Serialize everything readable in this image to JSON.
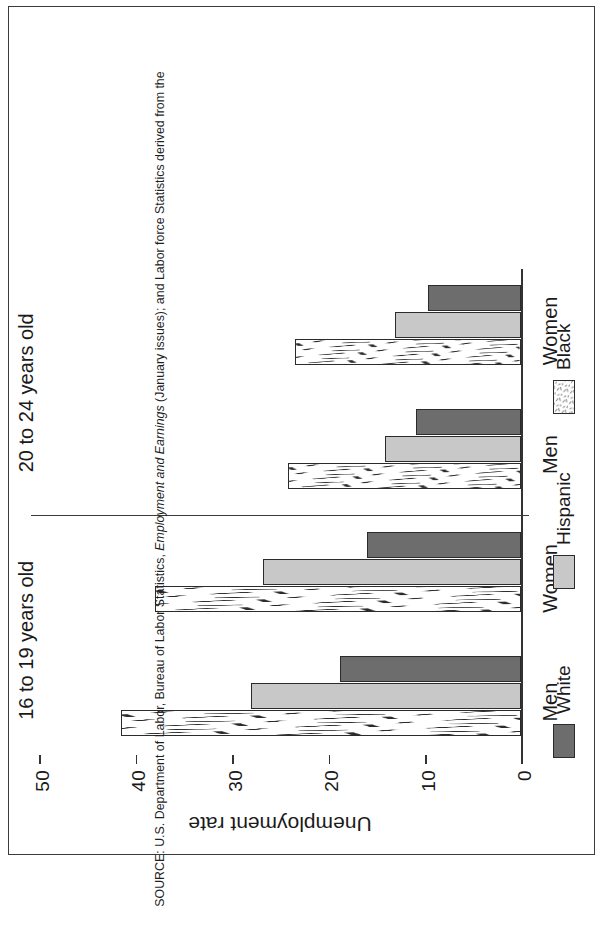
{
  "figure": {
    "axis_title": "Unemployment rate",
    "source_prefix": "SOURCE: U.S. Department of Labor, Bureau of Labor Statistics, ",
    "source_italic": "Employment and Earnings",
    "source_suffix": " (January issues); and Labor force Statistics derived from the",
    "orientation_note": "rotated-90-ccw"
  },
  "colors": {
    "white_series": "#6d6d6d",
    "hispanic_series": "#c8c8c8",
    "black_series": "#ffffff",
    "outline": "#2b2b2b",
    "frame": "#3b3b3b",
    "text": "#1a1a1a"
  },
  "legend": {
    "items": [
      {
        "label": "White",
        "key": "white"
      },
      {
        "label": "Hispanic",
        "key": "hispanic"
      },
      {
        "label": "Black",
        "key": "black"
      }
    ]
  },
  "chart_data": {
    "type": "bar",
    "title": "",
    "xlabel": "",
    "ylabel": "Unemployment rate",
    "ylim": [
      0,
      50
    ],
    "yticks": [
      0,
      10,
      20,
      30,
      40,
      50
    ],
    "ytick_labels": [
      "0",
      "10",
      "20",
      "30",
      "40",
      "50"
    ],
    "grid": false,
    "legend_position": "bottom",
    "orientation": "vertical-groups-rotated",
    "group_labels": [
      "16 to 19 years old",
      "20 to 24 years old"
    ],
    "categories": [
      "Men",
      "Women",
      "Men",
      "Women"
    ],
    "category_groups": [
      "16 to 19 years old",
      "16 to 19 years old",
      "20 to 24 years old",
      "20 to 24 years old"
    ],
    "series": [
      {
        "name": "White",
        "values": [
          18.8,
          16.0,
          10.9,
          9.6
        ]
      },
      {
        "name": "Hispanic",
        "values": [
          28.0,
          26.8,
          14.1,
          13.1
        ]
      },
      {
        "name": "Black",
        "values": [
          41.5,
          38.0,
          24.2,
          23.4
        ]
      }
    ]
  }
}
